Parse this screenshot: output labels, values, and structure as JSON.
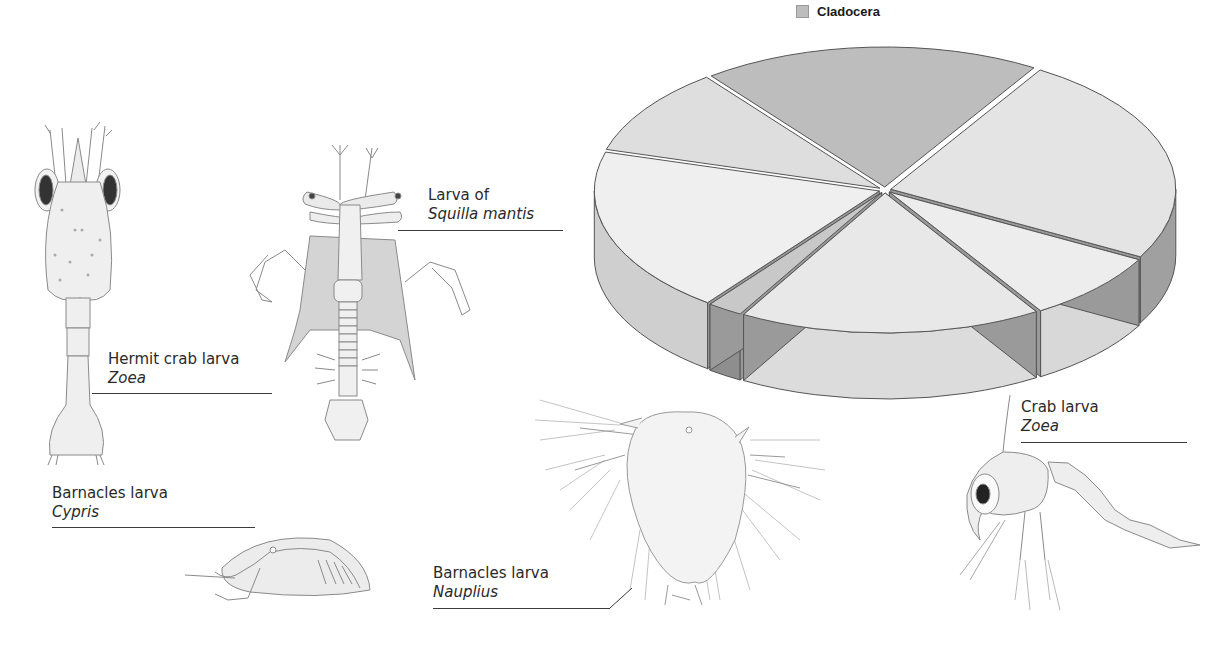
{
  "chart_data": {
    "type": "pie",
    "style": "3d-exploded",
    "title": "",
    "legend": {
      "position": "top-right",
      "entries": [
        {
          "label": "Cladocera",
          "color": "#bdbdbd"
        }
      ]
    },
    "slices": [
      {
        "label": "Cladocera",
        "value": 19,
        "color": "#bdbdbd",
        "side_color": "#8c8c8c"
      },
      {
        "label": "",
        "value": 24,
        "color": "#e4e4e4",
        "side_color": "#a0a0a0"
      },
      {
        "label": "",
        "value": 8,
        "color": "#ededed",
        "side_color": "#d8d8d8"
      },
      {
        "label": "",
        "value": 17,
        "color": "#e8e8e8",
        "side_color": "#dcdcdc"
      },
      {
        "label": "",
        "value": 2,
        "color": "#c8c8c8",
        "side_color": "#8e8e8e"
      },
      {
        "label": "",
        "value": 19,
        "color": "#efefef",
        "side_color": "#cfcfcf"
      },
      {
        "label": "",
        "value": 10,
        "color": "#dedede",
        "side_color": "#cfcfcf"
      }
    ],
    "units": "approximate percent (estimated from slice angles, no data labels shown)"
  },
  "legend": {
    "label": "Cladocera",
    "swatch_color": "#bdbdbd"
  },
  "illustrations": [
    {
      "id": "hermit",
      "line1": "Hermit crab larva",
      "line2": "Zoea"
    },
    {
      "id": "squilla",
      "line1": "Larva of",
      "line2": "Squilla mantis"
    },
    {
      "id": "cypris",
      "line1": "Barnacles larva",
      "line2": "Cypris"
    },
    {
      "id": "nauplius",
      "line1": "Barnacles larva",
      "line2": "Nauplius"
    },
    {
      "id": "crab",
      "line1": "Crab larva",
      "line2": "Zoea"
    }
  ]
}
